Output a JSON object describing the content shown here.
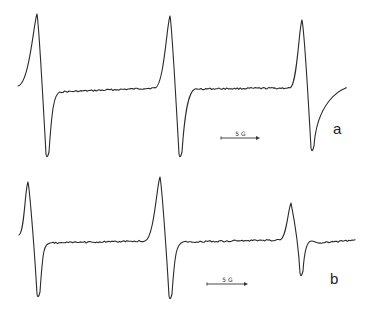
{
  "chart_data": {
    "type": "line",
    "title": "",
    "grid": false,
    "axes": false,
    "panels": [
      {
        "label": "a",
        "scale_bar": {
          "text": "5 G",
          "x1": 221,
          "x2": 260,
          "y": 138
        },
        "label_pos": {
          "x": 333,
          "y": 134
        },
        "baseline_y": 89,
        "lines": [
          {
            "start": [
              18,
              86
            ],
            "peak": [
              37,
              14
            ],
            "trough": [
              47,
              158
            ],
            "end": [
              60,
              92
            ]
          },
          {
            "start": [
              155,
              88
            ],
            "peak": [
              170,
              16
            ],
            "trough": [
              180,
              158
            ],
            "end": [
              195,
              89
            ]
          },
          {
            "start": [
              290,
              88
            ],
            "peak": [
              302,
              20
            ],
            "trough": [
              312,
              152
            ],
            "end": [
              346,
              88
            ]
          }
        ],
        "x_range": [
          18,
          346
        ]
      },
      {
        "label": "b",
        "scale_bar": {
          "text": "5 G",
          "x1": 207,
          "x2": 248,
          "y": 284
        },
        "label_pos": {
          "x": 330,
          "y": 284
        },
        "baseline_y": 241,
        "lines": [
          {
            "start": [
              19,
              235
            ],
            "peak": [
              28,
              182
            ],
            "trough": [
              38,
              298
            ],
            "end": [
              50,
              243
            ]
          },
          {
            "start": [
              145,
              241
            ],
            "peak": [
              160,
              177
            ],
            "trough": [
              170,
              300
            ],
            "end": [
              183,
              242
            ]
          },
          {
            "start": [
              280,
              240
            ],
            "peak": [
              291,
              203
            ],
            "trough": [
              301,
              277
            ],
            "end": [
              320,
              243
            ]
          }
        ],
        "x_range": [
          19,
          355
        ]
      }
    ]
  },
  "labels": {
    "panel_a": "a",
    "panel_b": "b",
    "scale_a": "5 G",
    "scale_b": "5 G"
  },
  "colors": {
    "trace": "#2a2a2a",
    "background": "#ffffff"
  }
}
